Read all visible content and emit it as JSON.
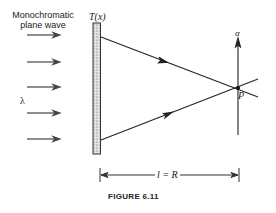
{
  "figure": {
    "caption": "FIGURE 6.11",
    "source_label_line1": "Monochromatic",
    "source_label_line2": "plane wave",
    "wavelength_symbol": "λ",
    "transmittance_label": "T(x)",
    "axis_label": "α",
    "point_label": "P",
    "distance_label": "l = R"
  },
  "colors": {
    "ink": "#222222",
    "background": "#ffffff",
    "slab_fill": "#d8d8d8"
  }
}
